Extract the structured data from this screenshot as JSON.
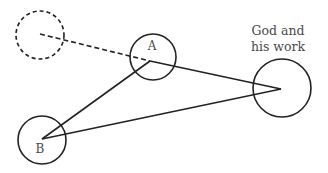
{
  "diagram": {
    "nodes": [
      {
        "id": "prior",
        "label": "",
        "style": "dashed"
      },
      {
        "id": "A",
        "label": "A",
        "style": "solid"
      },
      {
        "id": "B",
        "label": "B",
        "style": "solid"
      },
      {
        "id": "god",
        "label_line1": "God and",
        "label_line2": "his work",
        "style": "solid"
      }
    ],
    "edges": [
      {
        "from": "prior",
        "to": "A",
        "style": "dashed"
      },
      {
        "from": "A",
        "to": "god",
        "style": "solid"
      },
      {
        "from": "B",
        "to": "A",
        "style": "solid"
      },
      {
        "from": "B",
        "to": "god",
        "style": "solid"
      }
    ],
    "colors": {
      "stroke": "#222222",
      "text": "#4a4a4a",
      "background": "#ffffff"
    }
  }
}
